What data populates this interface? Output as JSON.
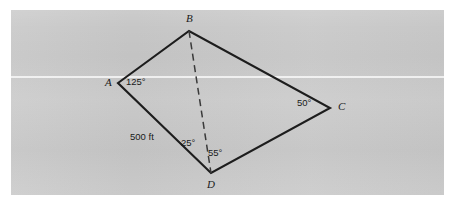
{
  "figure": {
    "type": "geometry-diagram",
    "shape": "quadrilateral",
    "background_color": "#c9c9c9",
    "page_color": "#ffffff",
    "line_color": "#1d1d1d",
    "dashed_line_color": "#3a3a3a",
    "vertices": [
      {
        "name": "A",
        "label": "A",
        "x": 118,
        "y": 83,
        "label_x": 105,
        "label_y": 78
      },
      {
        "name": "B",
        "label": "B",
        "x": 189,
        "y": 31,
        "label_x": 186,
        "label_y": 14
      },
      {
        "name": "C",
        "label": "C",
        "x": 330,
        "y": 108,
        "label_x": 338,
        "label_y": 102
      },
      {
        "name": "D",
        "label": "D",
        "x": 211,
        "y": 173,
        "label_x": 207,
        "label_y": 180
      }
    ],
    "edges": [
      {
        "name": "edge-AB",
        "from": "A",
        "to": "B",
        "style": "solid"
      },
      {
        "name": "edge-BC",
        "from": "B",
        "to": "C",
        "style": "solid"
      },
      {
        "name": "edge-CD",
        "from": "C",
        "to": "D",
        "style": "solid"
      },
      {
        "name": "edge-DA",
        "from": "D",
        "to": "A",
        "style": "solid"
      }
    ],
    "diagonal": {
      "name": "diagonal-BD",
      "from": "B",
      "to": "D",
      "style": "dashed"
    },
    "angles": [
      {
        "name": "angle-at-A",
        "vertex": "A",
        "value": "125°",
        "x": 126,
        "y": 78
      },
      {
        "name": "angle-BDA-at-D",
        "vertex": "D",
        "value": "25°",
        "x": 181,
        "y": 138
      },
      {
        "name": "angle-BDC-at-D",
        "vertex": "D",
        "value": "55°",
        "x": 208,
        "y": 148
      },
      {
        "name": "angle-at-C",
        "vertex": "C",
        "value": "50°",
        "x": 297,
        "y": 98
      }
    ],
    "lengths": [
      {
        "name": "length-AD",
        "edge": "edge-DA",
        "value": "500 ft",
        "x": 130,
        "y": 132
      }
    ]
  }
}
